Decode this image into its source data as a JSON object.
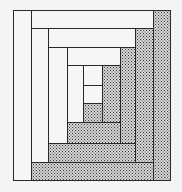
{
  "figure": {
    "title": "",
    "colors": {
      "background": "#f4f4f4",
      "light_fill": "#f6f6f6",
      "dark_fill": "#d6d6d6",
      "dot": "#3a3a3a",
      "line": "#2a2a2a"
    },
    "logs": [
      {
        "id": "center",
        "shade": "light",
        "x": 83,
        "y": 85,
        "w": 19,
        "h": 18
      },
      {
        "id": "ring1-top",
        "shade": "light",
        "x": 83,
        "y": 65,
        "w": 19,
        "h": 20
      },
      {
        "id": "ring1-bottom",
        "shade": "dark",
        "x": 83,
        "y": 103,
        "w": 19,
        "h": 19
      },
      {
        "id": "ring1-right",
        "shade": "dark",
        "x": 102,
        "y": 65,
        "w": 18,
        "h": 57
      },
      {
        "id": "ring1-left",
        "shade": "light",
        "x": 67,
        "y": 65,
        "w": 16,
        "h": 57
      },
      {
        "id": "ring2-bottom",
        "shade": "dark",
        "x": 67,
        "y": 122,
        "w": 53,
        "h": 21
      },
      {
        "id": "ring2-top",
        "shade": "light",
        "x": 48,
        "y": 47,
        "w": 72,
        "h": 18
      },
      {
        "id": "ring2-left",
        "shade": "light",
        "x": 48,
        "y": 47,
        "w": 19,
        "h": 96
      },
      {
        "id": "ring2-right",
        "shade": "dark",
        "x": 120,
        "y": 47,
        "w": 15,
        "h": 96
      },
      {
        "id": "ring3-bottom",
        "shade": "dark",
        "x": 48,
        "y": 143,
        "w": 87,
        "h": 19
      },
      {
        "id": "ring3-top",
        "shade": "light",
        "x": 31,
        "y": 28,
        "w": 104,
        "h": 19
      },
      {
        "id": "ring3-left",
        "shade": "light",
        "x": 31,
        "y": 28,
        "w": 17,
        "h": 134
      },
      {
        "id": "ring3-right",
        "shade": "dark",
        "x": 135,
        "y": 28,
        "w": 18,
        "h": 134
      },
      {
        "id": "ring4-bottom",
        "shade": "dark",
        "x": 31,
        "y": 162,
        "w": 122,
        "h": 18
      },
      {
        "id": "ring4-top",
        "shade": "light",
        "x": 13,
        "y": 10,
        "w": 140,
        "h": 18
      },
      {
        "id": "ring4-left",
        "shade": "light",
        "x": 13,
        "y": 10,
        "w": 18,
        "h": 170
      },
      {
        "id": "ring4-right",
        "shade": "dark",
        "x": 153,
        "y": 10,
        "w": 17,
        "h": 170
      }
    ]
  }
}
